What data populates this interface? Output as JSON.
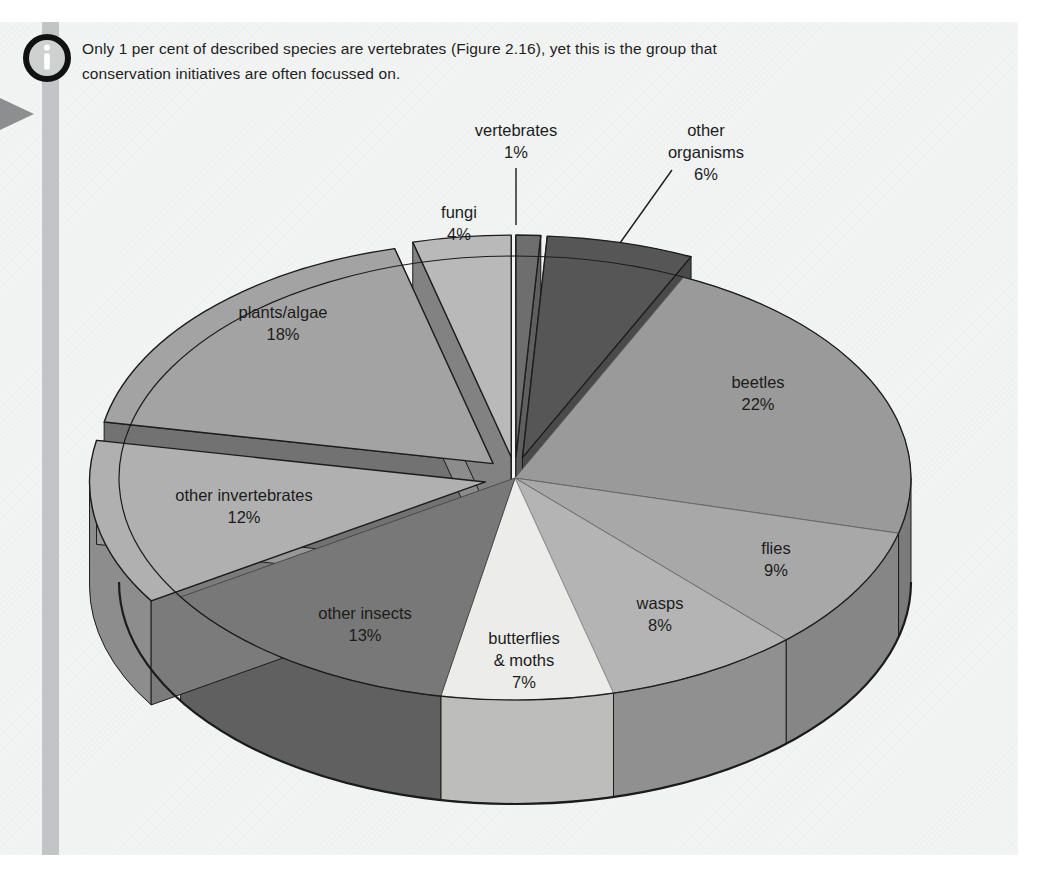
{
  "note": {
    "icon": "info-icon",
    "text": "Only 1 per cent of described species are vertebrates (Figure 2.16), yet this is the group that conservation initiatives are often focussed on.",
    "line1": "Only 1 per cent of described species are vertebrates (Figure 2.16), yet this is the group that",
    "line2": "conservation initiatives are often focussed on."
  },
  "margin_marker": {
    "icon": "triangle-right-icon"
  },
  "colors": {
    "page_background": "#f2f3f3",
    "rule": "#c3c4c5",
    "outline": "#1c1c1c",
    "text": "#1c1c1c",
    "vertebrates": "#6e6e6e",
    "other_organisms": "#565656",
    "beetles": "#9a9a9a",
    "flies": "#a8a8a8",
    "wasps": "#b4b4b4",
    "butterflies_moths": "#ececeb",
    "other_insects": "#787878",
    "other_invertebrates": "#b0b0b0",
    "plants_algae": "#a3a3a3",
    "fungi": "#b9b9b9"
  },
  "chart_data": {
    "type": "pie",
    "title": "",
    "unit": "%",
    "three_d": true,
    "start_angle_deg": 0,
    "direction": "clockwise",
    "total": 100,
    "categories": [
      "vertebrates",
      "other organisms",
      "beetles",
      "flies",
      "wasps",
      "butterflies & moths",
      "other insects",
      "other invertebrates",
      "plants/algae",
      "fungi"
    ],
    "values": [
      1,
      6,
      22,
      9,
      8,
      7,
      13,
      12,
      18,
      4
    ],
    "slices": [
      {
        "key": "vertebrates",
        "label": "vertebrates",
        "label_line2": "",
        "value": 1,
        "value_text": "1%",
        "color": "#6e6e6e",
        "exploded": true,
        "label_outside": true
      },
      {
        "key": "other_organisms",
        "label": "other",
        "label_line2": "organisms",
        "value": 6,
        "value_text": "6%",
        "color": "#565656",
        "exploded": true,
        "label_outside": true
      },
      {
        "key": "beetles",
        "label": "beetles",
        "label_line2": "",
        "value": 22,
        "value_text": "22%",
        "color": "#9a9a9a",
        "exploded": false,
        "label_outside": false
      },
      {
        "key": "flies",
        "label": "flies",
        "label_line2": "",
        "value": 9,
        "value_text": "9%",
        "color": "#a8a8a8",
        "exploded": false,
        "label_outside": false
      },
      {
        "key": "wasps",
        "label": "wasps",
        "label_line2": "",
        "value": 8,
        "value_text": "8%",
        "color": "#b4b4b4",
        "exploded": false,
        "label_outside": false
      },
      {
        "key": "butterflies_moths",
        "label": "butterflies",
        "label_line2": "& moths",
        "value": 7,
        "value_text": "7%",
        "color": "#ececeb",
        "exploded": false,
        "label_outside": false
      },
      {
        "key": "other_insects",
        "label": "other insects",
        "label_line2": "",
        "value": 13,
        "value_text": "13%",
        "color": "#787878",
        "exploded": false,
        "label_outside": false
      },
      {
        "key": "other_invertebrates",
        "label": "other invertebrates",
        "label_line2": "",
        "value": 12,
        "value_text": "12%",
        "color": "#b0b0b0",
        "exploded": true,
        "label_outside": false
      },
      {
        "key": "plants_algae",
        "label": "plants/algae",
        "label_line2": "",
        "value": 18,
        "value_text": "18%",
        "color": "#a3a3a3",
        "exploded": true,
        "label_outside": false
      },
      {
        "key": "fungi",
        "label": "fungi",
        "label_line2": "",
        "value": 4,
        "value_text": "4%",
        "color": "#b9b9b9",
        "exploded": true,
        "label_outside": false
      }
    ],
    "legend": "none",
    "xlabel": "",
    "ylabel": ""
  },
  "labels": {
    "vertebrates": {
      "l1": "vertebrates",
      "l2": "1%"
    },
    "other_organisms": {
      "l1": "other",
      "l2": "organisms",
      "l3": "6%"
    },
    "beetles": {
      "l1": "beetles",
      "l2": "22%"
    },
    "flies": {
      "l1": "flies",
      "l2": "9%"
    },
    "wasps": {
      "l1": "wasps",
      "l2": "8%"
    },
    "butterflies_moths": {
      "l1": "butterflies",
      "l2": "& moths",
      "l3": "7%"
    },
    "other_insects": {
      "l1": "other insects",
      "l2": "13%"
    },
    "other_invertebrates": {
      "l1": "other invertebrates",
      "l2": "12%"
    },
    "plants_algae": {
      "l1": "plants/algae",
      "l2": "18%"
    },
    "fungi": {
      "l1": "fungi",
      "l2": "4%"
    }
  }
}
